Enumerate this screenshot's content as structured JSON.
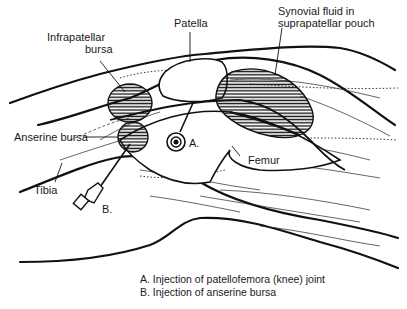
{
  "diagram": {
    "labels": {
      "patella": "Patella",
      "synovial_fluid": "Synovial fluid in suprapatellar pouch",
      "synovial_line1": "Synovial fluid in",
      "synovial_line2": "suprapatellar pouch",
      "infrapatellar_line1": "Infrapatellar",
      "infrapatellar_line2": "bursa",
      "anserine": "Anserine bursa",
      "femur": "Femur",
      "tibia": "Tibia",
      "needle_a": "A.",
      "needle_b": "B."
    },
    "caption": {
      "a": "A. Injection of patellofemora (knee) joint",
      "b": "B. Injection of anserine bursa"
    }
  }
}
